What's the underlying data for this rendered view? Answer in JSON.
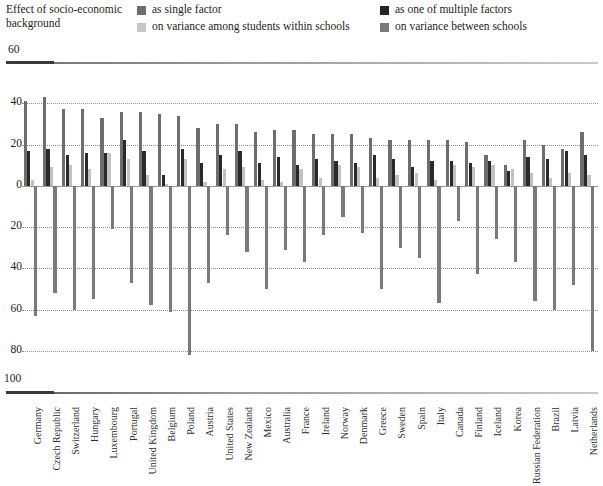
{
  "legend": {
    "title": "Effect of socio-economic background",
    "items": [
      {
        "label": "as single factor",
        "color": "#6e6e6e",
        "key": "single"
      },
      {
        "label": "as one of multiple factors",
        "color": "#2a2a2a",
        "key": "multiple"
      },
      {
        "label": "on variance among students within schools",
        "color": "#c2c2c2",
        "key": "within"
      },
      {
        "label": "on variance between schools",
        "color": "#7a7a7a",
        "key": "between"
      }
    ]
  },
  "axis": {
    "top_label": "60",
    "bottom_label": "100",
    "ticks": [
      "40",
      "20",
      "0",
      "20",
      "40",
      "60",
      "80"
    ],
    "tick_values": [
      40,
      20,
      0,
      -20,
      -40,
      -60,
      -80
    ],
    "ymax": 60,
    "ymin": -100
  },
  "chart_data": {
    "type": "bar",
    "title": "Effect of socio-economic background",
    "xlabel": "",
    "ylabel": "",
    "ylim": [
      -100,
      60
    ],
    "grid": true,
    "legend_position": "top",
    "categories": [
      "Germany",
      "Czech Republic",
      "Switzerland",
      "Hungary",
      "Luxembourg",
      "Portugal",
      "United Kingdom",
      "Belgium",
      "Poland",
      "Austria",
      "United States",
      "New Zealand",
      "Mexico",
      "Australia",
      "France",
      "Ireland",
      "Norway",
      "Denmark",
      "Greece",
      "Sweden",
      "Spain",
      "Italy",
      "Canada",
      "Finland",
      "Iceland",
      "Korea",
      "Russian Federation",
      "Brazil",
      "Latvia",
      "Netherlands"
    ],
    "series": [
      {
        "name": "as single factor",
        "color": "#6e6e6e",
        "values": [
          41,
          43,
          37,
          37,
          33,
          36,
          36,
          35,
          34,
          28,
          30,
          30,
          26,
          27,
          27,
          25,
          25,
          25,
          23,
          22,
          22,
          22,
          22,
          21,
          15,
          10,
          22,
          20,
          18,
          26
        ]
      },
      {
        "name": "as one of multiple factors",
        "color": "#2a2a2a",
        "values": [
          17,
          18,
          15,
          16,
          16,
          22,
          17,
          5,
          18,
          11,
          15,
          17,
          11,
          14,
          10,
          13,
          12,
          11,
          15,
          13,
          9,
          12,
          12,
          11,
          12,
          7,
          14,
          13,
          17,
          15
        ]
      },
      {
        "name": "on variance among students within schools",
        "color": "#c2c2c2",
        "values": [
          3,
          9,
          10,
          8,
          16,
          13,
          5,
          1,
          13,
          2,
          8,
          9,
          3,
          2,
          8,
          4,
          10,
          9,
          4,
          5,
          6,
          3,
          10,
          9,
          10,
          8,
          6,
          4,
          6,
          5
        ]
      },
      {
        "name": "on variance between schools",
        "color": "#7a7a7a",
        "values": [
          -63,
          -52,
          -60,
          -55,
          -21,
          -47,
          -58,
          -61,
          -82,
          -47,
          -24,
          -32,
          -50,
          -31,
          -37,
          -24,
          -15,
          -23,
          -50,
          -30,
          -35,
          -57,
          -17,
          -43,
          -26,
          -37,
          -56,
          -60,
          -48,
          -80
        ]
      }
    ]
  }
}
